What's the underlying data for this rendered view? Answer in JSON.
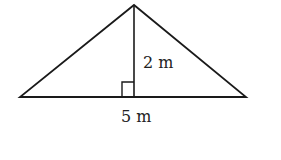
{
  "diagram": {
    "type": "triangle",
    "vertices": {
      "left": [
        20,
        97
      ],
      "right": [
        246,
        97
      ],
      "apex": [
        134,
        5
      ]
    },
    "height_foot": [
      134,
      97
    ],
    "right_angle_marker": {
      "x": 122,
      "y": 82,
      "size": 12
    },
    "labels": {
      "height": "2 m",
      "base": "5 m"
    },
    "colors": {
      "stroke": "#1a1a1a",
      "text": "#222222",
      "background": "#ffffff"
    }
  }
}
